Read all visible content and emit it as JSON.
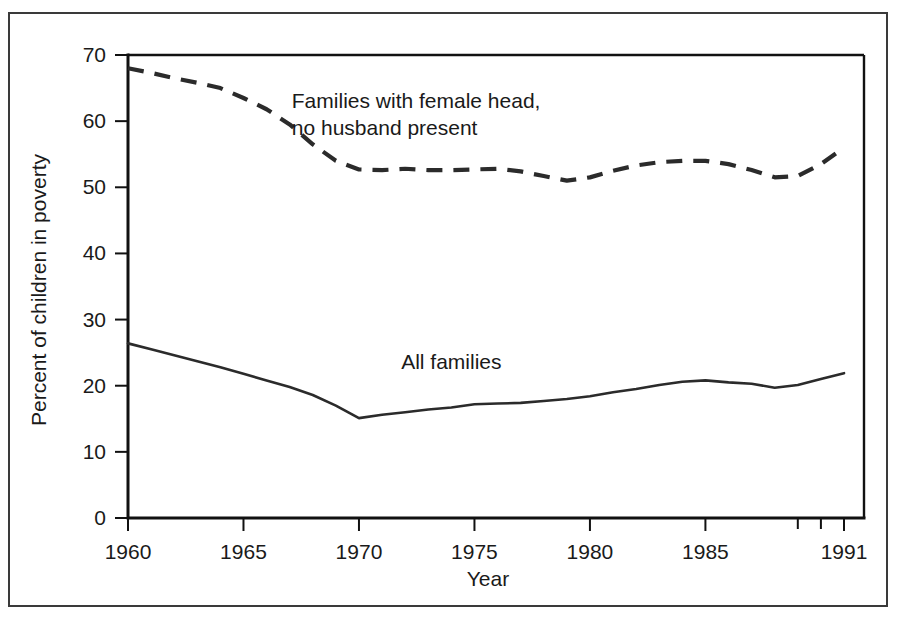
{
  "figure": {
    "background_color": "#ffffff",
    "frame_color": "#3a3a3a",
    "ink_color": "#2b2b2b"
  },
  "chart_data": {
    "type": "line",
    "title": "",
    "subtitle": "",
    "xlabel": "Year",
    "ylabel": "Percent of children in poverty",
    "xlim": [
      1960,
      1991
    ],
    "ylim": [
      0,
      70
    ],
    "grid": false,
    "legend_position": "inline-annotation",
    "x_ticks": [
      1960,
      1965,
      1970,
      1975,
      1980,
      1985,
      1991
    ],
    "x_tick_labels": [
      "1960",
      "1965",
      "1970",
      "1975",
      "1980",
      "1985",
      "1991"
    ],
    "x_minor_ticks": [
      1989,
      1990
    ],
    "y_ticks": [
      0,
      10,
      20,
      30,
      40,
      50,
      60,
      70
    ],
    "y_tick_labels": [
      "0",
      "10",
      "20",
      "30",
      "40",
      "50",
      "60",
      "70"
    ],
    "series": [
      {
        "name": "Families with female head, no husband present",
        "style": "dashed",
        "annotation_lines": [
          "Families with female head,",
          "no husband present"
        ],
        "annotation_x": 1973.5,
        "annotation_y": 62,
        "x": [
          1960,
          1961,
          1962,
          1963,
          1964,
          1965,
          1966,
          1967,
          1968,
          1969,
          1970,
          1971,
          1972,
          1973,
          1974,
          1975,
          1976,
          1977,
          1978,
          1979,
          1980,
          1981,
          1982,
          1983,
          1984,
          1985,
          1986,
          1987,
          1988,
          1989,
          1990,
          1991
        ],
        "values": [
          68.0,
          67.3,
          66.5,
          65.8,
          65.0,
          63.5,
          61.8,
          59.5,
          56.5,
          54.0,
          52.7,
          52.6,
          52.8,
          52.6,
          52.6,
          52.7,
          52.8,
          52.4,
          51.7,
          51.0,
          51.5,
          52.5,
          53.3,
          53.8,
          54.0,
          54.0,
          53.5,
          52.6,
          51.5,
          51.7,
          53.5,
          56.0
        ]
      },
      {
        "name": "All families",
        "style": "solid",
        "annotation_lines": [
          "All families"
        ],
        "annotation_x": 1974.0,
        "annotation_y": 22.5,
        "x": [
          1960,
          1961,
          1962,
          1963,
          1964,
          1965,
          1966,
          1967,
          1968,
          1969,
          1970,
          1971,
          1972,
          1973,
          1974,
          1975,
          1976,
          1977,
          1978,
          1979,
          1980,
          1981,
          1982,
          1983,
          1984,
          1985,
          1986,
          1987,
          1988,
          1989,
          1990,
          1991
        ],
        "values": [
          26.4,
          25.5,
          24.6,
          23.7,
          22.8,
          21.8,
          20.8,
          19.8,
          18.6,
          17.0,
          15.1,
          15.6,
          16.0,
          16.4,
          16.7,
          17.2,
          17.3,
          17.4,
          17.7,
          18.0,
          18.4,
          19.0,
          19.5,
          20.1,
          20.6,
          20.8,
          20.5,
          20.3,
          19.7,
          20.1,
          21.0,
          21.9
        ]
      }
    ]
  }
}
